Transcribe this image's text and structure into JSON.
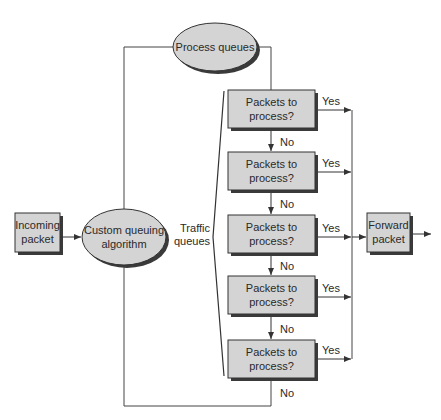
{
  "colors": {
    "node_fill": "#d4d4d4",
    "node_stroke": "#333333",
    "shadow": "#3a3a3a",
    "line": "#444444",
    "text": "#2a2a2a",
    "background": "#ffffff"
  },
  "nodes": {
    "incoming": {
      "line1": "Incoming",
      "line2": "packet"
    },
    "algorithm": {
      "line1": "Custom queuing",
      "line2": "algorithm"
    },
    "process_queues": {
      "label": "Process queues"
    },
    "forward": {
      "line1": "Forward",
      "line2": "packet"
    },
    "traffic_label": {
      "line1": "Traffic",
      "line2": "queues"
    },
    "queues": [
      {
        "line1": "Packets to",
        "line2": "process?",
        "yes": "Yes",
        "no": "No"
      },
      {
        "line1": "Packets to",
        "line2": "process?",
        "yes": "Yes",
        "no": "No"
      },
      {
        "line1": "Packets to",
        "line2": "process?",
        "yes": "Yes",
        "no": "No"
      },
      {
        "line1": "Packets to",
        "line2": "process?",
        "yes": "Yes",
        "no": "No"
      },
      {
        "line1": "Packets to",
        "line2": "process?",
        "yes": "Yes",
        "no": "No"
      }
    ]
  }
}
